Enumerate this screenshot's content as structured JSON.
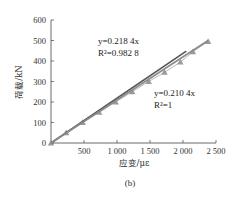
{
  "chart_data": {
    "type": "scatter",
    "title": "",
    "caption": "(b)",
    "xlabel": "应变/με",
    "ylabel": "荷载/kN",
    "xlim": [
      0,
      2500
    ],
    "ylim": [
      0,
      600
    ],
    "xticks": [
      500,
      1000,
      1500,
      2000,
      2500
    ],
    "xtick_labels": [
      "500",
      "1 000",
      "1 500",
      "2 000",
      "2 500"
    ],
    "yticks": [
      0,
      100,
      200,
      300,
      400,
      500,
      600
    ],
    "ytick_labels": [
      "0",
      "100",
      "200",
      "300",
      "400",
      "500",
      "600"
    ],
    "grid": false,
    "series": [
      {
        "name": "measured",
        "marker": "triangle",
        "color": "#9a9a9a",
        "x": [
          0,
          230,
          480,
          730,
          980,
          1230,
          1480,
          1720,
          1960,
          2150,
          2380
        ],
        "y": [
          0,
          50,
          100,
          150,
          200,
          250,
          300,
          345,
          395,
          445,
          495
        ]
      },
      {
        "name": "fit-1",
        "type": "line",
        "color": "#555555",
        "equation": "y=0.218 4x",
        "r2": "R²=0.982 8",
        "x": [
          0,
          2050
        ],
        "y": [
          0,
          448
        ]
      },
      {
        "name": "fit-2",
        "type": "line",
        "color": "#8a8a8a",
        "equation": "y=0.210 4x",
        "r2": "R²=1",
        "x": [
          0,
          2380
        ],
        "y": [
          0,
          500
        ]
      }
    ],
    "annotations": [
      {
        "text": "y=0.218 4x",
        "x": 700,
        "y": 520
      },
      {
        "text": "R²=0.982 8",
        "x": 700,
        "y": 465
      },
      {
        "text": "y=0.210 4x",
        "x": 1330,
        "y": 260
      },
      {
        "text": "R²=1",
        "x": 1330,
        "y": 205
      }
    ]
  },
  "labels": {
    "xlabel": "应变/με",
    "ylabel": "荷载/kN",
    "caption": "(b)",
    "eq1": "y=0.218 4x",
    "r2_1": "R²=0.982 8",
    "eq2": "y=0.210 4x",
    "r2_2": "R²=1"
  }
}
